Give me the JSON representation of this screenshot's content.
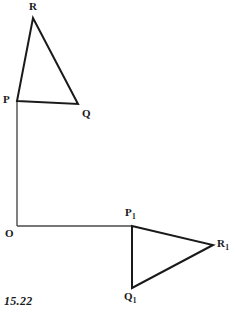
{
  "figure": {
    "caption": "15.22",
    "background_color": "#ffffff",
    "stroke_color": "#1a1a1a",
    "canvas": {
      "width": 235,
      "height": 313
    }
  },
  "labels": {
    "R": {
      "text": "R",
      "sub": ""
    },
    "P": {
      "text": "P",
      "sub": ""
    },
    "Q": {
      "text": "Q",
      "sub": ""
    },
    "O": {
      "text": "O",
      "sub": ""
    },
    "P1": {
      "text": "P",
      "sub": "1"
    },
    "R1": {
      "text": "R",
      "sub": "1"
    },
    "Q1": {
      "text": "Q",
      "sub": "1"
    }
  },
  "geometry": {
    "points": {
      "R": {
        "x": 33,
        "y": 18
      },
      "P": {
        "x": 17,
        "y": 101
      },
      "Q": {
        "x": 78,
        "y": 104
      },
      "O": {
        "x": 17,
        "y": 226
      },
      "P1": {
        "x": 132,
        "y": 226
      },
      "R1": {
        "x": 213,
        "y": 245
      },
      "Q1": {
        "x": 132,
        "y": 288
      }
    },
    "triangle_original": {
      "name": "PQR",
      "vertices": [
        "P",
        "Q",
        "R"
      ]
    },
    "triangle_image": {
      "name": "P1Q1R1",
      "vertices": [
        "P1",
        "Q1",
        "R1"
      ]
    },
    "axis_vertical": {
      "from": "P",
      "to": "O"
    },
    "axis_horizontal": {
      "from": "O",
      "to": "P1"
    },
    "stroke_width_triangle": 2,
    "stroke_width_axis": 1.4
  }
}
